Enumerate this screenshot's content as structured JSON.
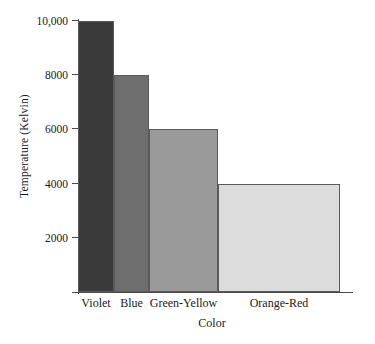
{
  "chart_data": {
    "type": "bar",
    "title": "",
    "xlabel": "Color",
    "ylabel": "Temperature (Kelvin)",
    "categories": [
      "Violet",
      "Blue",
      "Green-Yellow",
      "Orange-Red"
    ],
    "values": [
      10000,
      8000,
      6000,
      4000
    ],
    "ylim": [
      0,
      10000
    ],
    "yticks": [
      2000,
      4000,
      6000,
      8000,
      10000
    ],
    "ytick_labels": [
      "2000",
      "4000",
      "6000",
      "8000",
      "10,000"
    ],
    "grid": false,
    "legend": false,
    "bar_colors": [
      "#3a3a3a",
      "#6e6e6e",
      "#9a9a9a",
      "#dcdcdc"
    ],
    "bar_edge_color": "#5a5a5a",
    "axis_color": "#4a4a4a",
    "background": "#ffffff",
    "bar_widths_px": [
      36,
      35,
      69,
      122
    ],
    "annotations": []
  }
}
